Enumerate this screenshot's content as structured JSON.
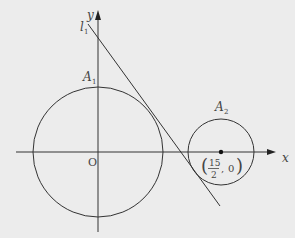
{
  "diagram": {
    "background": "#ececec",
    "stroke_color": "#333333",
    "axes": {
      "x_label": "x",
      "y_label": "y",
      "origin_label": "O"
    },
    "line": {
      "name": "l",
      "subscript": "1"
    },
    "circles": [
      {
        "name": "A",
        "subscript": "1",
        "center_label": ""
      },
      {
        "name": "A",
        "subscript": "2",
        "center_label": "(15/2, 0)",
        "center_x_num": "15",
        "center_x_den": "2",
        "center_y": "0"
      }
    ]
  }
}
